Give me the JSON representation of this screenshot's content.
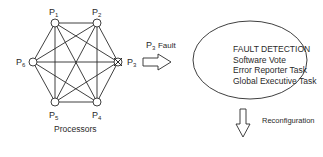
{
  "diagram": {
    "nodes": [
      {
        "id": "P1",
        "base": "P",
        "sub": "1"
      },
      {
        "id": "P2",
        "base": "P",
        "sub": "2"
      },
      {
        "id": "P3",
        "base": "P",
        "sub": "3",
        "status": "faulted"
      },
      {
        "id": "P4",
        "base": "P",
        "sub": "4"
      },
      {
        "id": "P5",
        "base": "P",
        "sub": "5"
      },
      {
        "id": "P6",
        "base": "P",
        "sub": "6"
      }
    ],
    "group_label": "Processors",
    "fault_arrow": {
      "base": "P",
      "sub": "3",
      "text": "Fault"
    },
    "detection_box": {
      "title": "FAULT DETECTION",
      "items": [
        "Software Vote",
        "Error Reporter Task",
        "Global Executive Task"
      ]
    },
    "output_arrow_label": "Reconfiguration",
    "colors": {
      "stroke": "#2a2a2a",
      "background": "#ffffff"
    }
  }
}
